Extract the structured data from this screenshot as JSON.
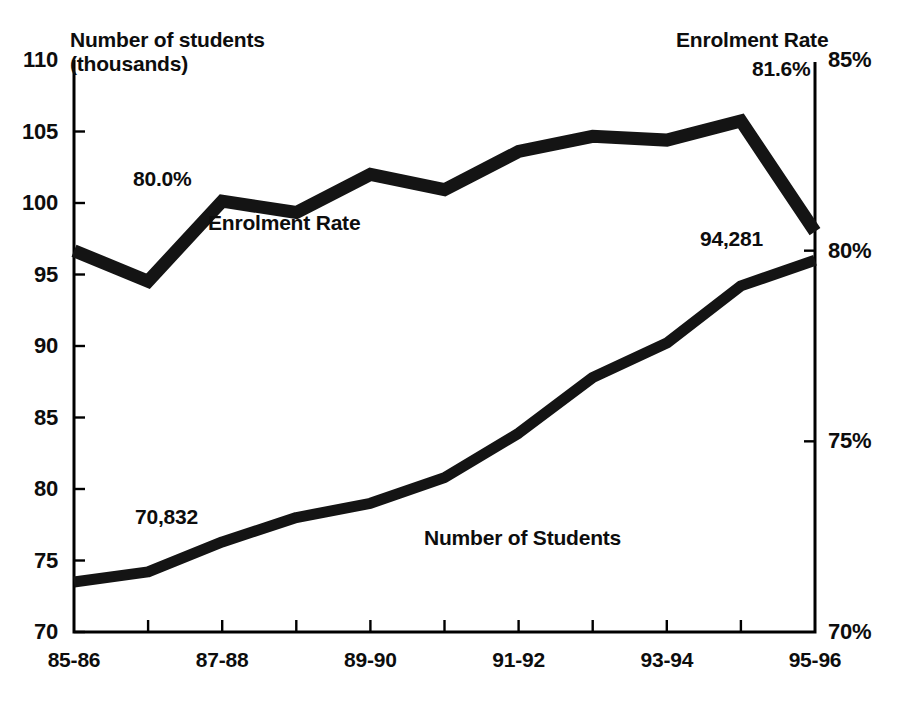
{
  "chart_data": {
    "type": "line",
    "title": "",
    "subtitle": "",
    "xlabel": "",
    "ylabel": "Number of students (thousands)",
    "y2label": "Enrolment Rate",
    "grid": false,
    "legend_position": "inline-annotations",
    "categories": [
      "85-86",
      "86-87",
      "87-88",
      "88-89",
      "89-90",
      "90-91",
      "91-92",
      "92-93",
      "93-94",
      "94-95",
      "95-96"
    ],
    "axis_left": {
      "title_line1": "Number of students",
      "title_line2": "(thousands)",
      "ticks": [
        110,
        105,
        100,
        95,
        90,
        85,
        80,
        75,
        70
      ],
      "tick_labels": [
        "110",
        "105",
        "100",
        "95",
        "90",
        "85",
        "80",
        "75",
        "70"
      ],
      "min": 70,
      "max": 110
    },
    "axis_right": {
      "title": "Enrolment Rate",
      "ticks": [
        85,
        80,
        75,
        70
      ],
      "tick_labels": [
        "85%",
        "80%",
        "75%",
        "70%"
      ],
      "min": 70,
      "max": 85
    },
    "x_tick_labels": [
      "85-86",
      "87-88",
      "89-90",
      "91-92",
      "93-94",
      "95-96"
    ],
    "series": [
      {
        "name": "Enrolment Rate",
        "inline_label": "Enrolment Rate",
        "axis": "right",
        "unit": "%",
        "values": [
          80.0,
          79.2,
          81.3,
          81.0,
          82.0,
          81.6,
          82.6,
          83.0,
          82.9,
          83.4,
          80.5
        ],
        "start_label": "80.0%",
        "end_label": "81.6%"
      },
      {
        "name": "Number of Students",
        "inline_label": "Number of Students",
        "axis": "left",
        "unit": "thousands",
        "values": [
          73.5,
          74.2,
          76.3,
          78.0,
          79.0,
          80.8,
          83.9,
          87.8,
          90.2,
          94.2,
          96.0
        ],
        "start_label": "70,832",
        "end_label": "94,281"
      }
    ],
    "annotations": [
      {
        "id": "enrolment-start",
        "text": "80.0%"
      },
      {
        "id": "enrolment-end",
        "text": "81.6%"
      },
      {
        "id": "students-start",
        "text": "70,832"
      },
      {
        "id": "students-end",
        "text": "94,281"
      },
      {
        "id": "enrolment-series",
        "text": "Enrolment Rate"
      },
      {
        "id": "students-series",
        "text": "Number of Students"
      },
      {
        "id": "right-axis-title",
        "text": "Enrolment Rate"
      }
    ],
    "colors": {
      "line": "#141414",
      "axis": "#000000",
      "text": "#0d0d0d",
      "background": "#ffffff"
    }
  }
}
